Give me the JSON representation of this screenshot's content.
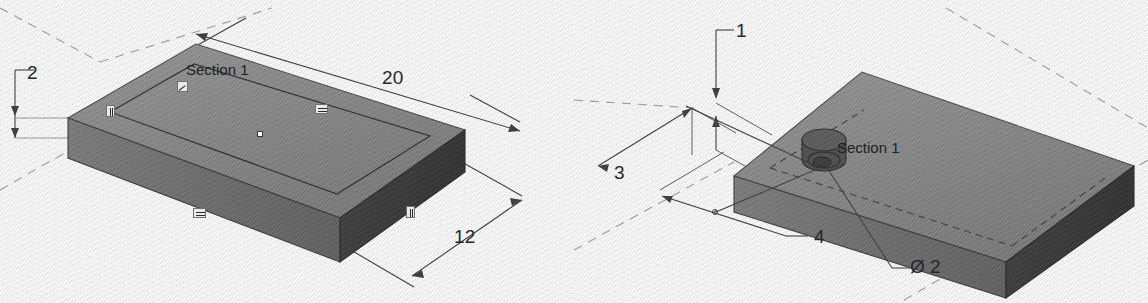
{
  "drawing": {
    "title": "Isometric plate sketch views",
    "background_color": "#fdfdfd",
    "line_color": "#2a2a2a",
    "top_face_color": "#8a8a8a",
    "front_face_color": "#6e6e6e",
    "side_face_color": "#3a3a3a",
    "construction_line_color": "#9a9a9a"
  },
  "figure_left": {
    "name": "plate-base-sketch-view",
    "section_label": "Section 1",
    "dimensions": [
      {
        "id": "thickness",
        "value": "2",
        "x": 27,
        "y": 62
      },
      {
        "id": "length",
        "value": "20",
        "x": 382,
        "y": 67
      },
      {
        "id": "width",
        "value": "12",
        "x": 454,
        "y": 226
      }
    ],
    "constraints": [
      {
        "id": "constraint-vertical-left",
        "type": "parallel-vertical",
        "x": 106,
        "y": 105
      },
      {
        "id": "constraint-horizontal-right",
        "type": "equal-horizontal",
        "x": 315,
        "y": 104
      },
      {
        "id": "constraint-horizontal-front",
        "type": "equal-horizontal",
        "x": 193,
        "y": 208
      },
      {
        "id": "constraint-vertical-right",
        "type": "parallel-vertical",
        "x": 406,
        "y": 206
      }
    ],
    "sketch_point": {
      "id": "sketch-origin-point",
      "x": 257,
      "y": 131
    },
    "section_icon": {
      "id": "section-plane-icon",
      "x": 177,
      "y": 81
    }
  },
  "figure_right": {
    "name": "plate-hole-sketch-view",
    "section_label": "Section 1",
    "diameter_label": "Ø 2",
    "dimensions": [
      {
        "id": "hole-depth",
        "value": "1",
        "x": 736,
        "y": 20
      },
      {
        "id": "hole-offset-y",
        "value": "3",
        "x": 614,
        "y": 162
      },
      {
        "id": "hole-offset-x",
        "value": "4",
        "x": 792,
        "y": 227
      }
    ],
    "feature": {
      "id": "cylindrical-boss",
      "label": "Section 1"
    }
  }
}
